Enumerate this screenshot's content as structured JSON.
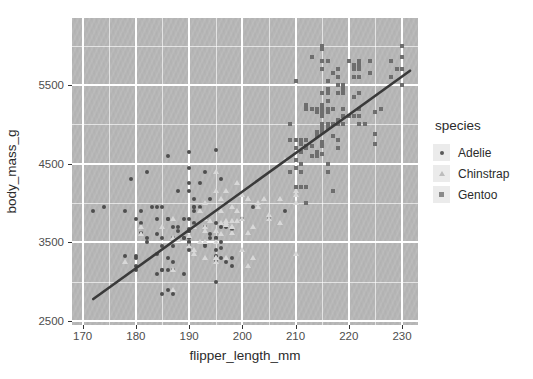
{
  "chart_data": {
    "type": "scatter",
    "title": "",
    "xlabel": "flipper_length_mm",
    "ylabel": "body_mass_g",
    "xlim": [
      168,
      233
    ],
    "ylim": [
      2450,
      6350
    ],
    "xticks": [
      170,
      180,
      190,
      200,
      210,
      220,
      230
    ],
    "yticks": [
      2500,
      3500,
      4500,
      5500
    ],
    "grid": true,
    "minor_grid": true,
    "panel_color": "#b7b7b7",
    "grid_color": "#ffffff",
    "legend": {
      "title": "species",
      "position": "right",
      "entries": [
        {
          "label": "Adelie",
          "marker": "circle",
          "color": "#5a5a5a"
        },
        {
          "label": "Chinstrap",
          "marker": "triangle",
          "color": "#bdbdbd"
        },
        {
          "label": "Gentoo",
          "marker": "square",
          "color": "#8a8a8a"
        }
      ]
    },
    "trendline": {
      "type": "linear",
      "color": "#3a3a3a",
      "width": 2.6,
      "x": [
        172.0,
        231.5
      ],
      "y": [
        2780,
        5680
      ]
    },
    "series": [
      {
        "name": "Adelie",
        "marker": "circle",
        "color": "#4e4e4e",
        "points": [
          [
            181,
            3750
          ],
          [
            186,
            3800
          ],
          [
            195,
            3250
          ],
          [
            193,
            3450
          ],
          [
            190,
            3650
          ],
          [
            181,
            3625
          ],
          [
            195,
            4675
          ],
          [
            193,
            3475
          ],
          [
            190,
            4250
          ],
          [
            186,
            3300
          ],
          [
            180,
            3325
          ],
          [
            182,
            3550
          ],
          [
            191,
            3950
          ],
          [
            198,
            3300
          ],
          [
            185,
            3150
          ],
          [
            195,
            3250
          ],
          [
            197,
            3700
          ],
          [
            184,
            3800
          ],
          [
            194,
            3600
          ],
          [
            174,
            3950
          ],
          [
            180,
            3800
          ],
          [
            189,
            3800
          ],
          [
            185,
            3550
          ],
          [
            180,
            3200
          ],
          [
            187,
            3150
          ],
          [
            183,
            3950
          ],
          [
            187,
            3250
          ],
          [
            172,
            3900
          ],
          [
            180,
            3300
          ],
          [
            178,
            3900
          ],
          [
            178,
            3325
          ],
          [
            188,
            4150
          ],
          [
            184,
            3950
          ],
          [
            195,
            3550
          ],
          [
            196,
            3300
          ],
          [
            190,
            4650
          ],
          [
            180,
            3150
          ],
          [
            181,
            3900
          ],
          [
            184,
            3100
          ],
          [
            182,
            4400
          ],
          [
            195,
            3000
          ],
          [
            186,
            4600
          ],
          [
            196,
            3425
          ],
          [
            185,
            3450
          ],
          [
            190,
            4150
          ],
          [
            182,
            3500
          ],
          [
            179,
            4300
          ],
          [
            190,
            3450
          ],
          [
            191,
            4050
          ],
          [
            186,
            2900
          ],
          [
            188,
            3700
          ],
          [
            190,
            3550
          ],
          [
            200,
            3800
          ],
          [
            187,
            2850
          ],
          [
            191,
            3750
          ],
          [
            186,
            3150
          ],
          [
            193,
            4400
          ],
          [
            181,
            3600
          ],
          [
            194,
            4050
          ],
          [
            185,
            2850
          ],
          [
            195,
            3750
          ],
          [
            185,
            3150
          ],
          [
            192,
            4250
          ],
          [
            184,
            3350
          ],
          [
            192,
            3950
          ],
          [
            195,
            3550
          ],
          [
            188,
            3650
          ],
          [
            190,
            3500
          ],
          [
            198,
            3675
          ],
          [
            190,
            4450
          ],
          [
            190,
            3400
          ],
          [
            196,
            4300
          ],
          [
            197,
            3250
          ],
          [
            190,
            3675
          ],
          [
            195,
            3325
          ],
          [
            191,
            3950
          ],
          [
            184,
            3600
          ],
          [
            187,
            3550
          ],
          [
            195,
            3400
          ],
          [
            189,
            3550
          ],
          [
            196,
            3700
          ],
          [
            187,
            3700
          ],
          [
            193,
            3700
          ],
          [
            191,
            3900
          ],
          [
            194,
            3550
          ],
          [
            190,
            3650
          ],
          [
            189,
            3100
          ],
          [
            189,
            3550
          ],
          [
            190,
            3800
          ],
          [
            202,
            3950
          ],
          [
            205,
            3800
          ],
          [
            185,
            3950
          ],
          [
            186,
            3800
          ],
          [
            187,
            3450
          ],
          [
            208,
            3900
          ],
          [
            190,
            3500
          ],
          [
            196,
            3500
          ],
          [
            198,
            3200
          ]
        ]
      },
      {
        "name": "Chinstrap",
        "marker": "triangle",
        "color": "#d8d8d8",
        "points": [
          [
            192,
            3500
          ],
          [
            196,
            3900
          ],
          [
            193,
            3650
          ],
          [
            188,
            3525
          ],
          [
            197,
            3725
          ],
          [
            198,
            3950
          ],
          [
            178,
            3250
          ],
          [
            197,
            3750
          ],
          [
            195,
            4150
          ],
          [
            198,
            3700
          ],
          [
            193,
            4000
          ],
          [
            194,
            3775
          ],
          [
            185,
            3700
          ],
          [
            201,
            4050
          ],
          [
            190,
            3575
          ],
          [
            201,
            4050
          ],
          [
            197,
            3300
          ],
          [
            181,
            3700
          ],
          [
            190,
            3450
          ],
          [
            195,
            4400
          ],
          [
            181,
            3600
          ],
          [
            191,
            3400
          ],
          [
            187,
            2900
          ],
          [
            193,
            3800
          ],
          [
            195,
            3300
          ],
          [
            197,
            4150
          ],
          [
            200,
            3400
          ],
          [
            200,
            3800
          ],
          [
            191,
            3700
          ],
          [
            205,
            3800
          ],
          [
            187,
            3550
          ],
          [
            201,
            3200
          ],
          [
            187,
            3150
          ],
          [
            203,
            3950
          ],
          [
            195,
            3250
          ],
          [
            199,
            3900
          ],
          [
            195,
            3300
          ],
          [
            210,
            4150
          ],
          [
            192,
            3900
          ],
          [
            205,
            3850
          ],
          [
            210,
            3350
          ],
          [
            187,
            3800
          ],
          [
            196,
            3750
          ],
          [
            196,
            3600
          ],
          [
            196,
            4050
          ],
          [
            191,
            3350
          ],
          [
            207,
            4050
          ],
          [
            202,
            3300
          ],
          [
            193,
            3700
          ],
          [
            210,
            4000
          ],
          [
            198,
            3775
          ],
          [
            200,
            4100
          ],
          [
            199,
            3775
          ],
          [
            201,
            3625
          ],
          [
            195,
            3500
          ],
          [
            204,
            4050
          ],
          [
            193,
            3300
          ],
          [
            208,
            4550
          ],
          [
            195,
            3650
          ],
          [
            207,
            3750
          ],
          [
            202,
            3700
          ],
          [
            193,
            3500
          ],
          [
            210,
            4100
          ],
          [
            198,
            3700
          ],
          [
            203,
            4000
          ],
          [
            197,
            3775
          ],
          [
            199,
            4250
          ],
          [
            198,
            3625
          ]
        ]
      },
      {
        "name": "Gentoo",
        "marker": "square",
        "color": "#6e6e6e",
        "points": [
          [
            211,
            4500
          ],
          [
            230,
            5700
          ],
          [
            210,
            4450
          ],
          [
            218,
            5700
          ],
          [
            215,
            5400
          ],
          [
            210,
            4550
          ],
          [
            211,
            4800
          ],
          [
            219,
            5200
          ],
          [
            209,
            4400
          ],
          [
            215,
            5150
          ],
          [
            214,
            4650
          ],
          [
            216,
            5550
          ],
          [
            214,
            4650
          ],
          [
            213,
            5850
          ],
          [
            210,
            4200
          ],
          [
            217,
            4150
          ],
          [
            210,
            4800
          ],
          [
            221,
            5750
          ],
          [
            209,
            5000
          ],
          [
            222,
            5200
          ],
          [
            218,
            4700
          ],
          [
            215,
            5800
          ],
          [
            213,
            4600
          ],
          [
            215,
            6000
          ],
          [
            215,
            4750
          ],
          [
            215,
            5950
          ],
          [
            215,
            4625
          ],
          [
            216,
            5450
          ],
          [
            215,
            4725
          ],
          [
            221,
            5350
          ],
          [
            211,
            4750
          ],
          [
            230,
            5850
          ],
          [
            214,
            5200
          ],
          [
            216,
            5400
          ],
          [
            214,
            5150
          ],
          [
            216,
            5300
          ],
          [
            216,
            5400
          ],
          [
            215,
            5700
          ],
          [
            210,
            4700
          ],
          [
            211,
            4650
          ],
          [
            212,
            5250
          ],
          [
            219,
            5200
          ],
          [
            209,
            4800
          ],
          [
            222,
            5000
          ],
          [
            212,
            4000
          ],
          [
            216,
            5800
          ],
          [
            212,
            4700
          ],
          [
            219,
            5100
          ],
          [
            215,
            5200
          ],
          [
            212,
            4700
          ],
          [
            216,
            4950
          ],
          [
            216,
            5200
          ],
          [
            210,
            5550
          ],
          [
            225,
            4875
          ],
          [
            217,
            5650
          ],
          [
            212,
            5200
          ],
          [
            224,
            5800
          ],
          [
            215,
            4950
          ],
          [
            221,
            5100
          ],
          [
            215,
            5250
          ],
          [
            215,
            4900
          ],
          [
            216,
            5000
          ],
          [
            218,
            5400
          ],
          [
            215,
            4775
          ],
          [
            219,
            5500
          ],
          [
            214,
            4850
          ],
          [
            223,
            5000
          ],
          [
            213,
            4725
          ],
          [
            222,
            5700
          ],
          [
            216,
            5400
          ],
          [
            216,
            5300
          ],
          [
            229,
            5700
          ],
          [
            222,
            5100
          ],
          [
            228,
            5600
          ],
          [
            217,
            5000
          ],
          [
            230,
            5500
          ],
          [
            216,
            4500
          ],
          [
            230,
            5700
          ],
          [
            217,
            4850
          ],
          [
            222,
            5600
          ],
          [
            215,
            5250
          ],
          [
            228,
            5800
          ],
          [
            211,
            4400
          ],
          [
            219,
            5000
          ],
          [
            218,
            5000
          ],
          [
            214,
            4600
          ],
          [
            216,
            5200
          ],
          [
            222,
            5800
          ],
          [
            211,
            4400
          ],
          [
            222,
            5750
          ],
          [
            213,
            5200
          ],
          [
            221,
            5700
          ],
          [
            212,
            4725
          ],
          [
            215,
            5000
          ],
          [
            216,
            4400
          ],
          [
            219,
            5000
          ],
          [
            229,
            5700
          ],
          [
            218,
            5600
          ],
          [
            219,
            5450
          ],
          [
            214,
            4900
          ],
          [
            216,
            5150
          ],
          [
            217,
            5200
          ],
          [
            225,
            5150
          ],
          [
            219,
            5400
          ],
          [
            218,
            4800
          ],
          [
            210,
            4800
          ],
          [
            220,
            5800
          ],
          [
            224,
            5650
          ],
          [
            212,
            4200
          ],
          [
            221,
            5600
          ],
          [
            226,
            5200
          ],
          [
            219,
            5500
          ],
          [
            230,
            6000
          ],
          [
            212,
            4800
          ],
          [
            215,
            5100
          ],
          [
            225,
            4750
          ],
          [
            216,
            5300
          ],
          [
            215,
            4900
          ],
          [
            218,
            5500
          ],
          [
            211,
            4200
          ],
          [
            216,
            5200
          ],
          [
            220,
            5100
          ],
          [
            218,
            5050
          ],
          [
            222,
            5400
          ],
          [
            215,
            4950
          ]
        ]
      }
    ]
  }
}
